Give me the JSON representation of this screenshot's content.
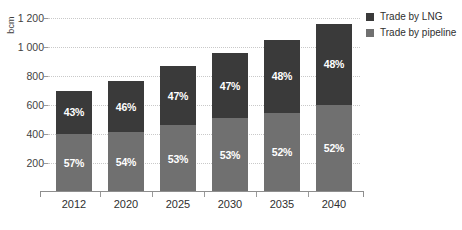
{
  "chart_data": {
    "type": "bar",
    "subtype": "stacked-bar-percent-labels",
    "title": "",
    "xlabel": "",
    "ylabel": "bcm",
    "ylim": [
      0,
      1200
    ],
    "ytick_values": [
      200,
      400,
      600,
      800,
      1000,
      1200
    ],
    "ytick_labels": [
      "200",
      "400",
      "600",
      "800",
      "1 000",
      "1 200"
    ],
    "grid": true,
    "legend_position": "right",
    "categories": [
      "2012",
      "2020",
      "2025",
      "2030",
      "2035",
      "2040"
    ],
    "totals": [
      700,
      765,
      870,
      960,
      1050,
      1160
    ],
    "series": [
      {
        "name": "Trade by pipeline",
        "color": "#707070",
        "values": [
          400,
          413,
          461,
          509,
          546,
          603
        ],
        "percent_labels": [
          "57%",
          "54%",
          "53%",
          "53%",
          "52%",
          "52%"
        ]
      },
      {
        "name": "Trade by LNG",
        "color": "#3a3a3a",
        "values": [
          300,
          352,
          409,
          451,
          504,
          557
        ],
        "percent_labels": [
          "43%",
          "46%",
          "47%",
          "47%",
          "48%",
          "48%"
        ]
      }
    ]
  },
  "axes": {
    "y_title": "bcm",
    "y_ticks": [
      {
        "label": "1 200",
        "value": 1200
      },
      {
        "label": "1 000",
        "value": 1000
      },
      {
        "label": "800",
        "value": 800
      },
      {
        "label": "600",
        "value": 600
      },
      {
        "label": "400",
        "value": 400
      },
      {
        "label": "200",
        "value": 200
      }
    ],
    "x_ticks": [
      "2012",
      "2020",
      "2025",
      "2030",
      "2035",
      "2040"
    ]
  },
  "legend": {
    "items": [
      {
        "label": "Trade by LNG",
        "color": "#3a3a3a"
      },
      {
        "label": "Trade by pipeline",
        "color": "#707070"
      }
    ]
  },
  "colors": {
    "lng": "#3a3a3a",
    "pipeline": "#707070",
    "gridline": "#c9c9c9",
    "axis": "#8e8e8e",
    "text": "#2f2f2f",
    "background": "#ffffff"
  }
}
